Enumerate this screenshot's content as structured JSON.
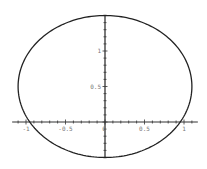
{
  "chart_data": {
    "type": "line",
    "title": "",
    "xlabel": "",
    "ylabel": "",
    "curve": "ellipse",
    "series": [
      {
        "name": "ellipse",
        "center": [
          0,
          0.5
        ],
        "radius_x": 1.1,
        "radius_y": 1.0,
        "color": "#222222"
      }
    ],
    "xlim": [
      -1.15,
      1.15
    ],
    "ylim": [
      -0.5,
      1.5
    ],
    "x_ticks": [
      -1,
      -0.5,
      0,
      0.5,
      1
    ],
    "x_tick_labels": [
      "-1",
      "-0.5",
      "0",
      "0.5",
      "1"
    ],
    "y_ticks": [
      0.5,
      1
    ],
    "y_tick_labels": [
      "0.5",
      "1"
    ],
    "grid": false,
    "legend": null
  }
}
